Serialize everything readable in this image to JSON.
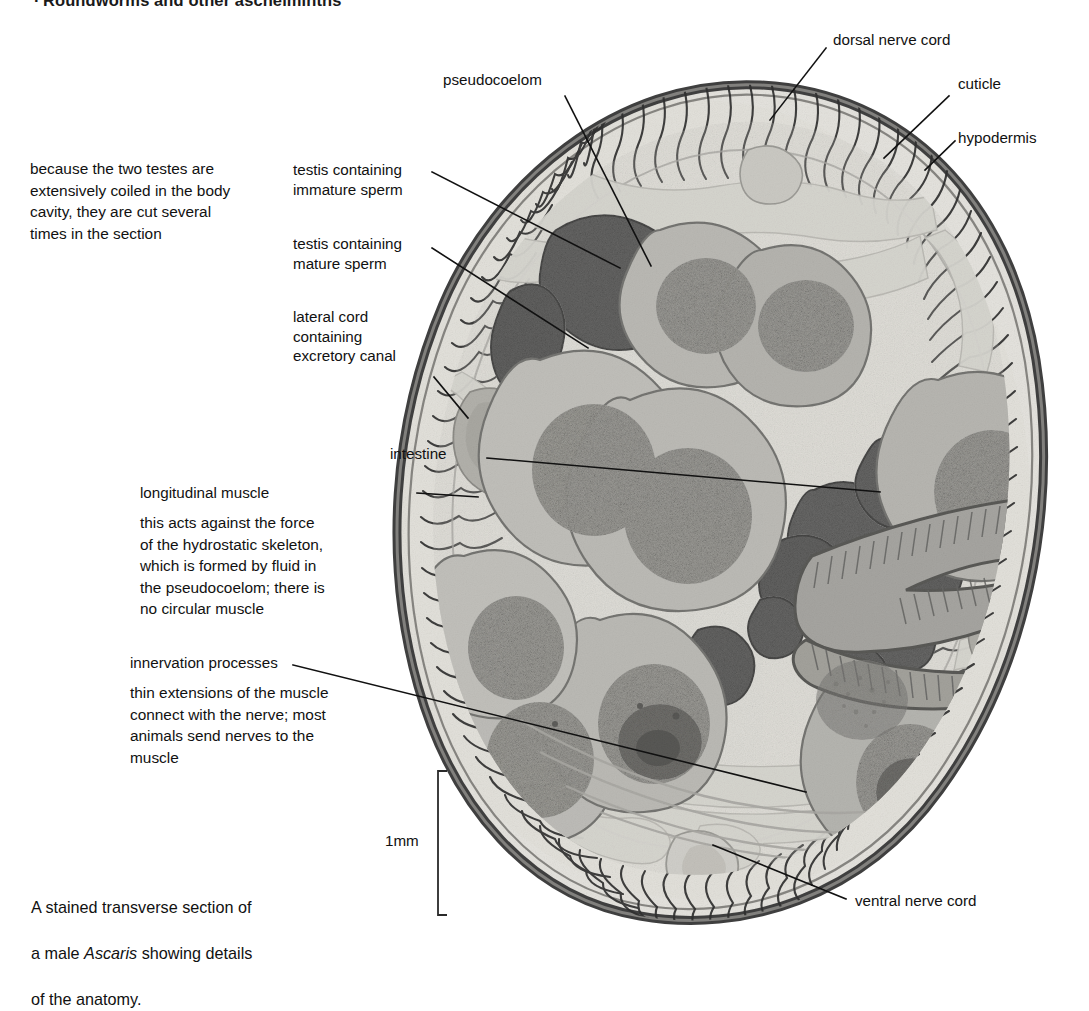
{
  "page": {
    "running_head": "Roundworms and other aschelminths",
    "background_color": "#ffffff",
    "width": 1089,
    "height": 957
  },
  "figure": {
    "kind": "light-micrograph",
    "caption": "A stained transverse section of\na male Ascaris showing details\nof the anatomy.",
    "caption_italic_word": "Ascaris",
    "scale_bar": {
      "label": "1mm",
      "orientation": "vertical",
      "bracket_top_y": 770,
      "bracket_bottom_y": 915
    },
    "palette": {
      "cuticle": "#4a4a4a",
      "hypodermis_fringe": "#3d3d3d",
      "pseudocoelom_fluid": "#e3e2dd",
      "immature_sperm_dark": "#4e4e4e",
      "mature_sperm_mottled": "#8a8a88",
      "intestine": "#7d7c79",
      "lateral_cord": "#9d9d99",
      "leader_line": "#111111"
    }
  },
  "labels": {
    "pseudocoelom": "pseudocoelom",
    "dorsal_nerve_cord": "dorsal nerve cord",
    "cuticle": "cuticle",
    "hypodermis": "hypodermis",
    "testis_immature": "testis containing\nimmature sperm",
    "testis_mature": "testis containing\nmature sperm",
    "lateral_cord": "lateral cord\ncontaining\nexcretory canal",
    "intestine": "intestine",
    "longitudinal_muscle": "longitudinal muscle",
    "innervation_processes": "innervation processes",
    "ventral_nerve_cord": "ventral nerve cord"
  },
  "notes": {
    "testes_note": "because the two testes are\nextensively coiled in the body\ncavity, they are cut several\ntimes in the section",
    "muscle_note": "this acts against the force\nof the hydrostatic skeleton,\nwhich is formed by fluid in\nthe pseudocoelom; there is\nno circular muscle",
    "innervation_note": "thin extensions of the muscle\nconnect with the nerve; most\nanimals send nerves to the\nmuscle"
  }
}
